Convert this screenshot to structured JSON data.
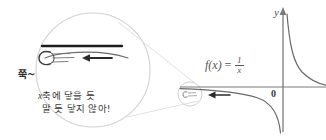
{
  "figure": {
    "kind": "handwritten-math-illustration",
    "background_color": "#ffffff",
    "ink_color": "#4a4a4a",
    "graph": {
      "function_label": {
        "fx": "f(x)",
        "equals": "=",
        "numerator": "1",
        "denominator": "x"
      },
      "y_axis_label": "y",
      "origin_label": "0",
      "curve_name": "hyperbola-one-over-x",
      "axis_color": "#6b6b6b",
      "curve_color": "#5a5a5a"
    },
    "magnifier": {
      "lens_name": "magnifier-lens-circle",
      "source_circle_name": "magnified-source-circle",
      "lens_color": "#cfcfcf",
      "x_axis_name": "magnified-x-axis",
      "curve_name": "magnified-approaching-curve",
      "comet_name": "comet-ball-with-motion-lines",
      "arrow_name": "leftward-direction-arrow"
    },
    "annotations": {
      "jjuk": "쭉~",
      "note_line_1_prefix": "x",
      "note_line_1": "축에 닿을 듯",
      "note_line_2": "말 듯 닿지 않아!",
      "arrow_left_graph": "leftward-arrow-on-graph"
    }
  }
}
